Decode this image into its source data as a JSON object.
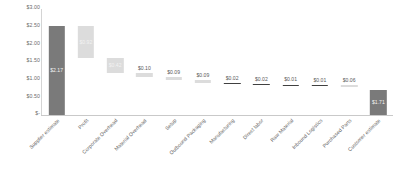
{
  "chart_data": {
    "type": "bar",
    "subtype": "waterfall",
    "title": "",
    "xlabel": "",
    "ylabel": "",
    "ylim": [
      0,
      3.0
    ],
    "grid": false,
    "legend": null,
    "y_ticks": [
      "$3.00",
      "$2.50",
      "$2.00",
      "$1.50",
      "$1.00",
      "$0.50",
      "$-"
    ],
    "y_tick_values": [
      3.0,
      2.5,
      2.0,
      1.5,
      1.0,
      0.5,
      0.0
    ],
    "categories": [
      "Supplier estimate",
      "Profit",
      "Corporate Overhead",
      "Material Overhead",
      "Setup",
      "Outbound Packaging",
      "Manufacturing",
      "Direct labor",
      "Raw Material",
      "Inbound Logistics",
      "Purchased Parts",
      "Customer estimate"
    ],
    "values": [
      2.52,
      0.92,
      0.42,
      0.1,
      0.09,
      0.09,
      0.02,
      0.02,
      0.01,
      0.01,
      0.06,
      0.71
    ],
    "labels": [
      "$2.17",
      "$0.92",
      "$0.42",
      "$0.10",
      "$0.09",
      "$0.09",
      "$0.02",
      "$0.02",
      "$0.01",
      "$0.01",
      "$0.06",
      "$1.71"
    ],
    "bar_kinds": [
      "total",
      "delta",
      "delta",
      "delta",
      "delta",
      "delta",
      "delta",
      "delta",
      "delta",
      "delta",
      "delta",
      "total"
    ],
    "bar_bases": [
      0.0,
      1.6,
      1.18,
      1.08,
      0.99,
      0.9,
      0.88,
      0.86,
      0.85,
      0.84,
      0.78,
      0.0
    ],
    "label_placement": [
      "inside",
      "inside",
      "inside",
      "above",
      "above",
      "above",
      "above",
      "above",
      "above",
      "above",
      "above",
      "inside"
    ],
    "colors": {
      "total_bar": "#7a7a7a",
      "delta_bar": "#dcdcdc",
      "flat_bar": "#404040",
      "axis": "#c9c9c9",
      "tick_text": "#6b6b6b",
      "label_text": "#5a5a5a",
      "inside_label_text": "#f2f2f2",
      "background": "#ffffff"
    }
  }
}
